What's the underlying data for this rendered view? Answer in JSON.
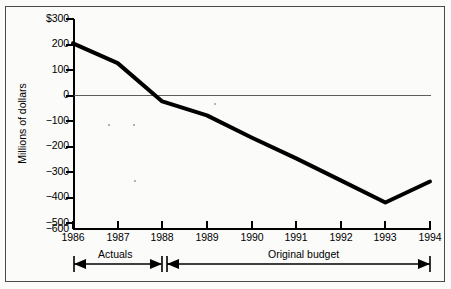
{
  "chart_data": {
    "type": "line",
    "title": "",
    "xlabel": "",
    "ylabel": "Millions of dollars",
    "x": [
      1986,
      1987,
      1988,
      1989,
      1990,
      1991,
      1992,
      1993,
      1994
    ],
    "categories": [
      "1986",
      "1987",
      "1988",
      "1989",
      "1990",
      "1991",
      "1992",
      "1993",
      "1994"
    ],
    "values": [
      195,
      110,
      -55,
      -115,
      -210,
      -300,
      -395,
      -490,
      -400
    ],
    "series": [
      {
        "name": "Budget balance",
        "values": [
          195,
          110,
          -55,
          -115,
          -210,
          -300,
          -395,
          -490,
          -400
        ]
      }
    ],
    "ylim": [
      -600,
      300
    ],
    "yticks": [
      300,
      200,
      100,
      0,
      -100,
      -200,
      -300,
      -400,
      -500,
      -600
    ],
    "ytick_labels": [
      "$300",
      "200",
      "100",
      "0",
      "−100",
      "−200",
      "−300",
      "−400",
      "−500",
      "−600"
    ],
    "xlim": [
      1986,
      1994
    ],
    "grid": false,
    "zero_line": true,
    "legend": "none",
    "line_color": "#000000",
    "annotations": [
      {
        "label": "Actuals",
        "from": "1986",
        "to": "1988"
      },
      {
        "label": "Original budget",
        "from": "1988",
        "to": "1994"
      }
    ]
  },
  "axis": {
    "y_title": "Millions of dollars"
  },
  "brackets": {
    "actuals": "Actuals",
    "original_budget": "Original budget"
  }
}
